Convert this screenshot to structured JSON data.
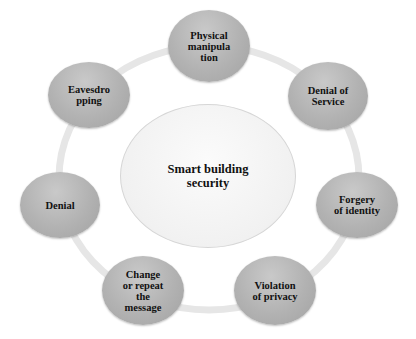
{
  "diagram": {
    "type": "cycle",
    "center": {
      "label": "Smart building\nsecurity"
    },
    "nodes": [
      {
        "id": "physical-manipulation",
        "label": "Physical\nmanipula\ntion"
      },
      {
        "id": "denial-of-service",
        "label": "Denial of\nService"
      },
      {
        "id": "forgery-of-identity",
        "label": "Forgery\nof identity"
      },
      {
        "id": "violation-of-privacy",
        "label": "Violation\nof privacy"
      },
      {
        "id": "change-or-repeat-the-message",
        "label": "Change\nor repeat\nthe\nmessage"
      },
      {
        "id": "denial",
        "label": "Denial"
      },
      {
        "id": "eavesdropping",
        "label": "Eavesdro\npping"
      }
    ],
    "colors": {
      "node_fill": "#b2b2b2",
      "ring": "#e4e4e4",
      "center_fill": "#f3f3f3",
      "text": "#111111"
    }
  }
}
